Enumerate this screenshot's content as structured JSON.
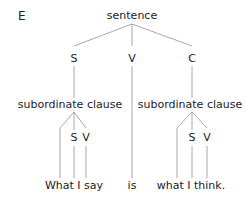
{
  "panel_label": "E",
  "root": "sentence",
  "level1": {
    "s": "S",
    "v": "V",
    "c": "C"
  },
  "left_clause": {
    "label": "subordinate clause",
    "s": "S",
    "v": "V",
    "text": "What I say"
  },
  "verb_text": "is",
  "right_clause": {
    "label": "subordinate clause",
    "s": "S",
    "v": "V",
    "text": "what I think."
  },
  "colors": {
    "lines": "#a8a8a8",
    "text": "#222222"
  }
}
